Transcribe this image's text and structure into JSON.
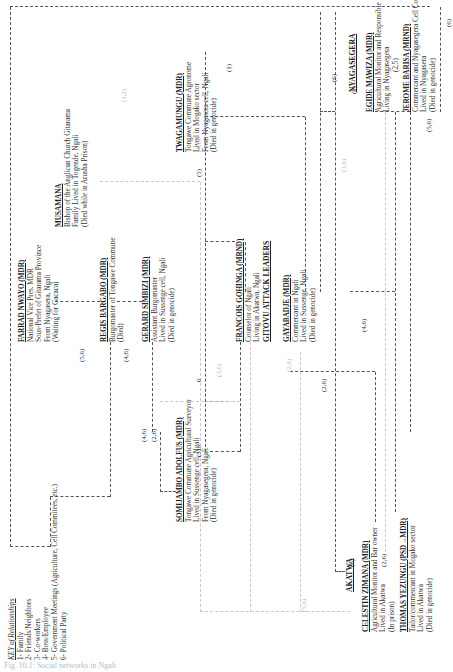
{
  "figure": {
    "caption": "Fig. 10.1: Social networks in Ngali"
  },
  "key": {
    "title": "KEY of Relationships",
    "items": [
      "1- Family",
      "2- Friends/Neighbors",
      "3- Co-workers",
      "4- Boss/Employee",
      "5- Government Meetings (Agriculture, Cell Commitees, etc.)",
      "6- Political Party"
    ]
  },
  "headings": {
    "gitovu": "GITOVU ATTACK LEADERS",
    "akatwa": "AKATWA",
    "nyagasegera": "NYAGASEGERA"
  },
  "nodes": {
    "musamana": {
      "name": "MUSAMANA",
      "lines": [
        "Bishop of the Anglican Church Gitarama",
        "Family Lived in Togende, Ngali",
        "(Died while in Arusha Prison)"
      ]
    },
    "nwayo": {
      "name": "FARRAD NWAYO (MDR)",
      "lines": [
        "National Vice Pres. MDR",
        "Sous-Prefet of Gitarama Province",
        "From Nyagasera, Ngali",
        "(Waiting for Gacaca)"
      ]
    },
    "bargabo": {
      "name": "REGIS BARGABO (MDR)",
      "lines": [
        "Burgomaster of Tongawe Commune",
        "(Died)"
      ]
    },
    "simbizi": {
      "name": "GERARD SIMBIZI (MDR)",
      "lines": [
        "Assistant Burgomaster",
        "Lived in Sussenge cell, Ngali",
        "(Died in genocide)"
      ]
    },
    "somijambo": {
      "name": "SOMIJAMBO ADOLFUS (MDR)",
      "lines": [
        "Tongawe Commune Agricultural Surveyor",
        "Lived in Sussenge cell, Ngali",
        "From Nyagasegera, Ngali",
        "(Died in genocide)"
      ]
    },
    "twagamungu": {
      "name": "TWAGAMUNGU (MDR)",
      "lines": [
        "Tongawe Commune Agronome",
        "Lived in Mogako sector",
        "From Nyagasera cell, Ngali",
        "(Died in genocide)"
      ]
    },
    "gohinga": {
      "name": "FRANCOIS GOHINGA (MRND)",
      "lines": [
        "Counselor of Ngali",
        "Living in Akatwa, Ngali"
      ]
    },
    "gayabadje": {
      "name": "GAYABADJE (MDR)",
      "lines": [
        "Commercant in Ngali",
        "Lived in Sussenge, Ngali",
        "(Died in genocide)"
      ]
    },
    "mawiza": {
      "name": "EGIDE MAWIZA (MDR)",
      "lines": [
        "Agricultural Monitor and Responsible",
        "Living in Nyagasegera",
        "(2,5)"
      ]
    },
    "barisa": {
      "name": "JEROME BARISA (MRND)",
      "lines": [
        "Commercant and Nyagasegera Cell Committee",
        "Lived in Nyagasera",
        "(Died in genocide)"
      ]
    },
    "zimana": {
      "name": "CELESTIN ZIMANA (MDR)",
      "lines": [
        "Agricultural Monitor and Bar owner",
        "Lived in Akatwa",
        "(In prison)"
      ]
    },
    "yezungu": {
      "name": "THOMAS YEZUNGU (PSD→MDR)",
      "lines": [
        "Tailor/commercant in Mogako sector",
        "Lived in Akatwa",
        "(Died in genocide)"
      ]
    }
  },
  "edge_labels": {
    "l56a": "(5,6)",
    "l46a": "(4,6)",
    "l46b": "(4,6)",
    "l26a": "(2,6)",
    "l5a": "(5)",
    "l5b": "(5)",
    "l1": "(1)",
    "l1b": "(1)",
    "l6a": "(6)",
    "l6b": "(6)",
    "l6c": "(6)",
    "l46c": "(4,6)",
    "l26b": "(2,6)",
    "l26c": "(2,6)",
    "l56b": "(5,6)",
    "l0": "0",
    "f36a": "(3,6)",
    "f36b": "(3,6)",
    "f26": "(2,6)",
    "f46": "(4,6)",
    "f12": "(1,2)",
    "f56": "(5,6)"
  }
}
